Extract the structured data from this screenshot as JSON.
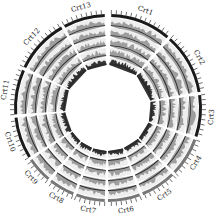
{
  "figure": {
    "type": "circos",
    "center": [
      108,
      108
    ],
    "colors": {
      "ideogram": "#1a1a1a",
      "ideogram_alt": "#777777",
      "track_bg": "#eeeeee",
      "track_fill": "#8a8a8a",
      "track_dark": "#2a2a2a",
      "tick": "#333333"
    },
    "chromosomes": [
      {
        "label": "Crt1",
        "start_deg": 2,
        "end_deg": 40
      },
      {
        "label": "Crt2",
        "start_deg": 42,
        "end_deg": 80
      },
      {
        "label": "Crt3",
        "start_deg": 82,
        "end_deg": 108
      },
      {
        "label": "Crt4",
        "start_deg": 110,
        "end_deg": 134
      },
      {
        "label": "Crt5",
        "start_deg": 136,
        "end_deg": 158
      },
      {
        "label": "Crt6",
        "start_deg": 160,
        "end_deg": 180
      },
      {
        "label": "Crt7",
        "start_deg": 182,
        "end_deg": 200
      },
      {
        "label": "Crt8",
        "start_deg": 202,
        "end_deg": 218
      },
      {
        "label": "Crt9",
        "start_deg": 220,
        "end_deg": 236
      },
      {
        "label": "Crt10",
        "start_deg": 238,
        "end_deg": 264
      },
      {
        "label": "Crt11",
        "start_deg": 266,
        "end_deg": 294
      },
      {
        "label": "Crt12",
        "start_deg": 296,
        "end_deg": 330
      },
      {
        "label": "Crt13",
        "start_deg": 332,
        "end_deg": 358
      }
    ],
    "tracks": [
      {
        "name": "track-1",
        "r_inner": 82,
        "r_outer": 90
      },
      {
        "name": "track-2",
        "r_inner": 72,
        "r_outer": 80
      },
      {
        "name": "track-3",
        "r_inner": 62,
        "r_outer": 70
      },
      {
        "name": "track-4",
        "r_inner": 52,
        "r_outer": 60
      },
      {
        "name": "track-5",
        "r_inner": 43,
        "r_outer": 50
      }
    ],
    "ideogram": {
      "r_inner": 91,
      "r_outer": 94
    },
    "ticks": {
      "r_inner": 94,
      "r_outer": 98,
      "step_deg": 3
    },
    "label_radius": 104
  }
}
